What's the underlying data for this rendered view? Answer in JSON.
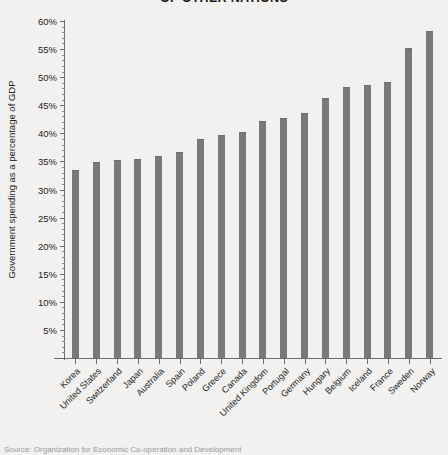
{
  "chart_data": {
    "type": "bar",
    "title": "OF OTHER NATIONS",
    "xlabel": "",
    "ylabel": "Government spending as a percentage of GDP",
    "ylim": [
      0,
      60
    ],
    "ytick_step": 5,
    "ytick_minor_step": 1,
    "grid": false,
    "legend": "none",
    "bar_color": "#797979",
    "background_color": "#f2f1ef",
    "axis_color": "#6e6e6e",
    "ytick_labels": [
      "60%",
      "55%",
      "50%",
      "45%",
      "40%",
      "35%",
      "30%",
      "25%",
      "20%",
      "15%",
      "10%",
      "5%"
    ],
    "ytick_values": [
      60,
      55,
      50,
      45,
      40,
      35,
      30,
      25,
      20,
      15,
      10,
      5
    ],
    "categories": [
      "Korea",
      "United States",
      "Switzerland",
      "Japan",
      "Australia",
      "Spain",
      "Poland",
      "Greece",
      "Canada",
      "United Kingdom",
      "Portugal",
      "Germany",
      "Hungary",
      "Belgium",
      "Iceland",
      "France",
      "Sweden",
      "Norway"
    ],
    "values": [
      33.3,
      34.7,
      35.0,
      35.3,
      35.8,
      36.5,
      38.8,
      39.6,
      40.1,
      42.1,
      42.5,
      43.4,
      46.1,
      48.1,
      48.4,
      49.0,
      55.0,
      58.1
    ],
    "source": "Source: Organization for Economic Co-operation and Development"
  }
}
